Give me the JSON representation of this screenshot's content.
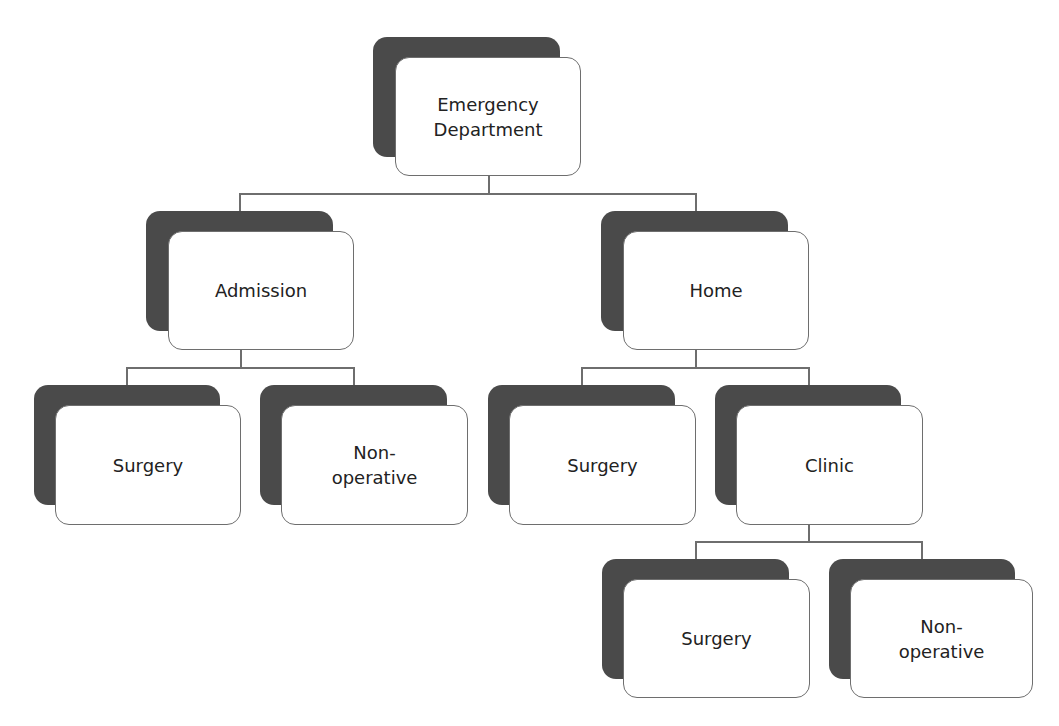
{
  "diagram": {
    "type": "tree",
    "colors": {
      "shadow": "#4a4a4a",
      "box_fill": "#ffffff",
      "box_border": "#6e6e6e",
      "connector": "#6e6e6e",
      "text": "#222222"
    },
    "nodes": {
      "emergency_department": {
        "label": "Emergency\nDepartment"
      },
      "admission": {
        "label": "Admission",
        "parent": "emergency_department"
      },
      "home": {
        "label": "Home",
        "parent": "emergency_department"
      },
      "admission_surgery": {
        "label": "Surgery",
        "parent": "admission"
      },
      "admission_nonoperative": {
        "label": "Non-\noperative",
        "parent": "admission"
      },
      "home_surgery": {
        "label": "Surgery",
        "parent": "home"
      },
      "clinic": {
        "label": "Clinic",
        "parent": "home"
      },
      "clinic_surgery": {
        "label": "Surgery",
        "parent": "clinic"
      },
      "clinic_nonoperative": {
        "label": "Non-\noperative",
        "parent": "clinic"
      }
    }
  }
}
